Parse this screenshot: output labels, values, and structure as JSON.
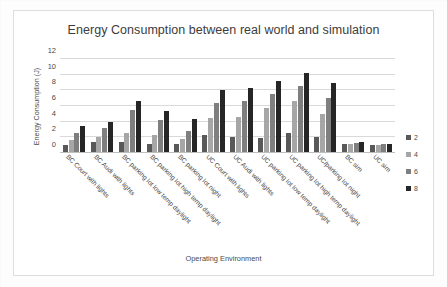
{
  "chart_data": {
    "type": "bar",
    "title": "Energy Consumption between real world and simulation",
    "xlabel": "Operating Environment",
    "ylabel": "Energy Consumption (J)",
    "ylim": [
      0,
      12
    ],
    "yticks": [
      0,
      2,
      4,
      6,
      8,
      10,
      12
    ],
    "grid": true,
    "legend_position": "right",
    "legend_title": "",
    "categories": [
      "BC Court with lights",
      "BC Audi with lights",
      "BC parking lot low temp daylight",
      "BC parking lot high temp daylight",
      "BC parking lot  night",
      "UC Court with lights",
      "UC Audi with lights",
      "UC parking lot low temp daylight",
      "UC parking lot high temp daylight",
      "UC/parking lot  night",
      "BC sim",
      "UC sim"
    ],
    "series": [
      {
        "name": "2",
        "color": "#595959",
        "values": [
          1.0,
          1.4,
          1.4,
          1.2,
          1.1,
          2.3,
          2.1,
          1.9,
          2.6,
          2.1,
          1.1,
          1.0
        ]
      },
      {
        "name": "4",
        "color": "#a6a6a6",
        "values": [
          1.7,
          2.1,
          2.6,
          2.3,
          1.8,
          4.5,
          4.6,
          5.7,
          6.6,
          5.0,
          1.2,
          1.0
        ]
      },
      {
        "name": "6",
        "color": "#7f7f7f",
        "values": [
          2.6,
          3.2,
          5.5,
          4.2,
          2.8,
          6.4,
          6.6,
          7.5,
          8.6,
          7.0,
          1.3,
          1.1
        ]
      },
      {
        "name": "8",
        "color": "#262626",
        "values": [
          3.4,
          4.0,
          6.6,
          5.3,
          4.3,
          8.0,
          8.3,
          9.2,
          10.2,
          9.0,
          1.35,
          1.1
        ]
      }
    ]
  }
}
